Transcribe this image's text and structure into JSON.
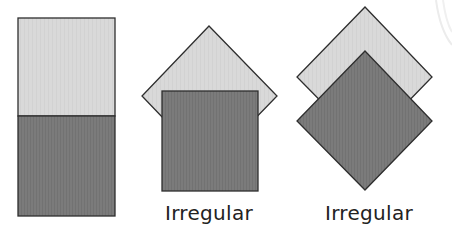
{
  "colors": {
    "light_fill": "#d9d9d9",
    "dark_fill": "#7b7b7b",
    "stroke": "#2e2e2e",
    "text": "#222222",
    "background": "#ffffff"
  },
  "figures": [
    {
      "id": "stacked-rectangle",
      "description": "Two equal squares stacked vertically forming a rectangle (light on top, dark below)",
      "label": ""
    },
    {
      "id": "square-over-diamond",
      "description": "Dark square overlapping a light square rotated 45 degrees",
      "label": "Irregular"
    },
    {
      "id": "diamond-over-diamond",
      "description": "Dark diamond overlapping a light diamond, offset vertically",
      "label": "Irregular"
    }
  ]
}
